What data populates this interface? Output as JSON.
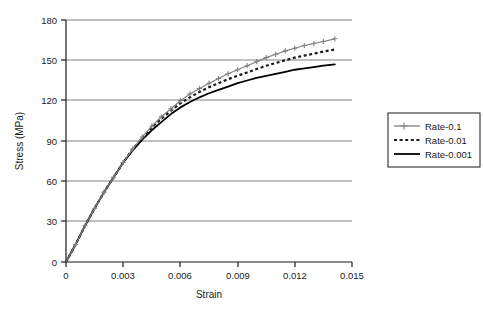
{
  "chart_data": {
    "type": "line",
    "title": "",
    "xlabel": "Strain",
    "ylabel": "Stress (MPa)",
    "xlim": [
      0,
      0.015
    ],
    "ylim": [
      0,
      180
    ],
    "xticks": [
      "0",
      "0.003",
      "0.006",
      "0.009",
      "0.012",
      "0.015"
    ],
    "xtick_values": [
      0,
      0.003,
      0.006,
      0.009,
      0.012,
      0.015
    ],
    "yticks": [
      "0",
      "30",
      "60",
      "90",
      "120",
      "150",
      "180"
    ],
    "ytick_values": [
      0,
      30,
      60,
      90,
      120,
      150,
      180
    ],
    "grid": "horizontal",
    "legend_position": "right",
    "series": [
      {
        "name": "Rate-0.1",
        "color": "#808080",
        "style": "solid-with-markers",
        "marker": "plus",
        "x": [
          0,
          0.0005,
          0.001,
          0.0015,
          0.002,
          0.0025,
          0.003,
          0.0035,
          0.004,
          0.0045,
          0.005,
          0.0055,
          0.006,
          0.0065,
          0.007,
          0.0075,
          0.008,
          0.0085,
          0.009,
          0.0095,
          0.01,
          0.0105,
          0.011,
          0.0115,
          0.012,
          0.0125,
          0.013,
          0.0135,
          0.0141
        ],
        "y": [
          0,
          13,
          27,
          40,
          52,
          63,
          74,
          84,
          93,
          101,
          108,
          114,
          120,
          125,
          129,
          133,
          136.5,
          140,
          143,
          146,
          149,
          152,
          154.5,
          157,
          159,
          161,
          162.5,
          164,
          166
        ]
      },
      {
        "name": "Rate-0.01",
        "color": "#1a1a1a",
        "style": "dotted",
        "marker": "none",
        "x": [
          0,
          0.0005,
          0.001,
          0.0015,
          0.002,
          0.0025,
          0.003,
          0.0035,
          0.004,
          0.0045,
          0.005,
          0.0055,
          0.006,
          0.0065,
          0.007,
          0.0075,
          0.008,
          0.0085,
          0.009,
          0.0095,
          0.01,
          0.0105,
          0.011,
          0.0115,
          0.012,
          0.0125,
          0.013,
          0.0135,
          0.0141
        ],
        "y": [
          0,
          13,
          27,
          40,
          52,
          63,
          74,
          84,
          92,
          100,
          106.5,
          112.5,
          118,
          122.5,
          126.5,
          130,
          133,
          136,
          138.5,
          141,
          143.5,
          146,
          148,
          150,
          152,
          153.5,
          155,
          156.5,
          158
        ]
      },
      {
        "name": "Rate-0.001",
        "color": "#000000",
        "style": "solid",
        "marker": "none",
        "x": [
          0,
          0.0005,
          0.001,
          0.0015,
          0.002,
          0.0025,
          0.003,
          0.0035,
          0.004,
          0.0045,
          0.005,
          0.0055,
          0.006,
          0.0065,
          0.007,
          0.0075,
          0.008,
          0.0085,
          0.009,
          0.0095,
          0.01,
          0.0105,
          0.011,
          0.0115,
          0.012,
          0.0125,
          0.013,
          0.0135,
          0.0141
        ],
        "y": [
          0,
          13,
          27,
          40,
          52,
          63,
          74,
          83,
          91,
          98,
          104,
          110,
          115,
          119,
          122.5,
          125.5,
          128,
          130.5,
          133,
          135,
          137,
          138.5,
          140,
          141.5,
          143,
          144,
          145,
          146,
          147
        ]
      }
    ]
  },
  "legend": {
    "entries": [
      {
        "label": "Rate-0.1"
      },
      {
        "label": "Rate-0.01"
      },
      {
        "label": "Rate-0.001"
      }
    ]
  }
}
